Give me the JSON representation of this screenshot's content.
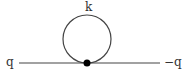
{
  "diagram": {
    "type": "feynman-tadpole",
    "labels": {
      "loop_momentum": "k",
      "incoming": "q",
      "outgoing": "−q"
    },
    "colors": {
      "line": "#444444",
      "vertex": "#000000",
      "text": "#333333"
    },
    "geometry": {
      "line": {
        "x1": 19,
        "y1": 63,
        "x2": 160,
        "y2": 63
      },
      "loop": {
        "cx": 87,
        "cy": 39,
        "r": 24
      },
      "vertex": {
        "cx": 87,
        "cy": 63,
        "r": 3.5
      }
    }
  }
}
